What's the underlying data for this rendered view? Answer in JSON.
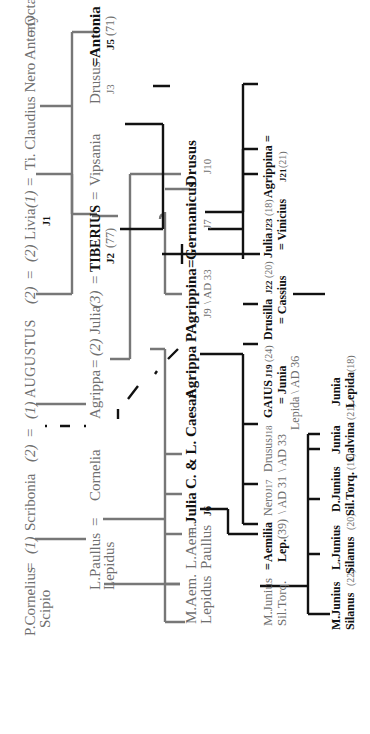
{
  "diagram": {
    "colors": {
      "first_generation": "#6f6f6f",
      "later_generation": "#111111",
      "background": "#ffffff"
    },
    "orientation": "rotated 90 degrees counter-clockwise",
    "row1": {
      "p_cornelius": "P.Cornelius",
      "scipio": "Scipio",
      "eq1": "=",
      "m1": "(1)",
      "scribonia": "Scribonia",
      "m2": "(2)",
      "eq2": "=",
      "m3": "(1)",
      "augustus": "AUGUSTUS",
      "m4": "(2)",
      "eq3": "=",
      "m5": "(2)",
      "livia": "Livia",
      "m6": "(1)",
      "eq4": "=",
      "ti_claudius_nero": "Ti. Claudius Nero",
      "antony": "Antony",
      "eq5": "=",
      "octavia": "Octavia",
      "livia_id": "J1"
    },
    "row2": {
      "l_paullus": "L.Paullus",
      "lepidus": "Lepidus",
      "eq1": "=",
      "cornelia": "Cornelia",
      "agrippa": "Agrippa",
      "eq2": "=",
      "m1": "(2)",
      "julia": "Julia",
      "m2": "(3)",
      "eq3": "=",
      "tiberius": "TIBERIUS",
      "tiberius_id": "J2",
      "tiberius_age": "(77)",
      "eq4": "=",
      "vipsania": "Vipsania",
      "drusus": "Drusus",
      "drusus_id": "J3",
      "eq5": "=",
      "antonia": "Antonia",
      "antonia_id": "J5",
      "antonia_age": "(71)",
      "l_domitius": "L. Domitius Ah.",
      "eq6": "=",
      "antonia2": "Antonia",
      "antonia2_id": "J4",
      "antonia2_death": "†AD 33"
    },
    "row3": {
      "m_aem": "M.Aem.",
      "lepidus": "Lepidus",
      "l_aem": "L.Aem.",
      "eq1": "=",
      "paullus": "Paullus",
      "julia": "Julia",
      "julia_id": "J6",
      "c_l_caesar": "C. & L. Caesar",
      "agrippa_p": "Agrippa P.",
      "agrippina": "Agrippina",
      "eq2": "=",
      "agrippina_id": "J9",
      "agrippina_death": "\\ AD 33",
      "germanicus": "Germanicus",
      "germanicus_id": "J7",
      "drusus": "Drusus",
      "drusus_id": "J10",
      "eq3": "=",
      "livilla": "Livilla",
      "livilla_id": "J11",
      "livilla_death": "\\ AD31",
      "claudius": "CLAUDIUS",
      "claudius_marriage": "(2)",
      "eq4": "=",
      "claudius_id": "J12",
      "claudius_age": "(45)",
      "aelia": "Aelia",
      "paetina": "Paetina",
      "messallina": "Messallina",
      "messallina_id": "J25",
      "messallina_age": "(16)",
      "dom_lepida": "Dom. Lepida",
      "dom_lepida_age": "(39)",
      "dom_lepida2": "Dom. Lepida",
      "dom_lepida2_id": "J14",
      "dom_lepida2_age": "(34)"
    },
    "row4": {
      "m_junius": "M.Junius",
      "sil_torq": "Sil.Torq.",
      "eq1": "=",
      "aemilia": "Aemilia",
      "aemilia_lep": "Lep.",
      "aemilia_age": "(39)",
      "nero": "Nero",
      "nero_id": "J17",
      "nero_death": "\\ AD 31",
      "drusus": "Drusus",
      "drusus_id": "J18",
      "drusus_death": "\\ AD 33",
      "gaius": "GAIUS",
      "gaius_id": "J19",
      "gaius_age": "(24)",
      "gaius_spouse": "= Junia",
      "gaius_spouse_sub": "Lepida \\ AD 36",
      "drusilla": "Drusilla",
      "drusilla_id": "J22",
      "drusilla_age": "(20)",
      "drusilla_spouse": "= Cassius",
      "julia": "Julia",
      "julia_id": "J23",
      "julia_age": "(18)",
      "julia_spouse": "= Vinicius",
      "agrippina": "Agrippina",
      "eq2": "=",
      "agrippina_id": "J21",
      "agrippina_age": "(21)",
      "cn_dom": "Cn. Dom.",
      "cn_dom_ah": "Ah.",
      "cn_dom_id": "J13",
      "cn_dom_age": "(37)",
      "julia2": "Julia",
      "julia2_id": "J16",
      "julia2_age": "(30)",
      "tib_gemellus": "Tib. Gemellus",
      "tib_gemellus_id": "J24",
      "tib_gemellus_age": "(17)",
      "antonia": "Antonia",
      "antonia_id": "J26",
      "antonia_age": "(8)"
    },
    "row5": {
      "m_junius": "M.Junius",
      "m_junius_sub": "Silanus",
      "m_junius_age": "(22)",
      "l_junius": "L.Junius",
      "l_junius_sub": "Silanus",
      "l_junius_age": "(20)",
      "d_junius": "D.Junius",
      "d_junius_sub": "Sil.Torq.",
      "d_junius_age": "(19)",
      "junia_calvina": "Junia",
      "junia_calvina_sub": "Calvina",
      "junia_calvina_age": "(21)",
      "junia_lepida": "Junia",
      "junia_lepida_sub": "Lepida",
      "junia_lepida_age": "(18)",
      "rubellius": "Rubellius",
      "plautus": "Plautus",
      "plautus_id": "J24",
      "plautus_age": "(2)"
    }
  }
}
